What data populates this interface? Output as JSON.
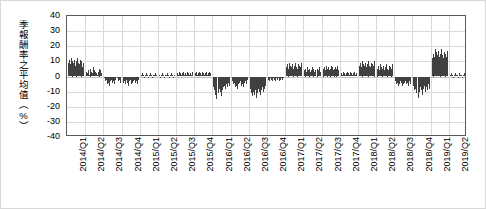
{
  "chart_data": {
    "type": "bar",
    "title": "",
    "subtitle": "",
    "xlabel": "",
    "ylabel": "季報酬率之平均值（%）",
    "ylim": [
      -40,
      40
    ],
    "ytick_labels": [
      "40",
      "30",
      "20",
      "10",
      "0",
      "-10",
      "-20",
      "-30",
      "-40"
    ],
    "ytick_values": [
      40,
      30,
      20,
      10,
      0,
      -10,
      -20,
      -30,
      -40
    ],
    "grid": true,
    "legend": false,
    "legend_position": "none",
    "bar_color": "#404040",
    "categories": [
      "2014/Q1",
      "2014/Q2",
      "2014/Q3",
      "2014/Q4",
      "2015/Q1",
      "2015/Q2",
      "2015/Q3",
      "2015/Q4",
      "2016/Q1",
      "2016/Q2",
      "2016/Q3",
      "2016/Q4",
      "2017/Q1",
      "2017/Q2",
      "2017/Q3",
      "2017/Q4",
      "2018/Q1",
      "2018/Q2",
      "2018/Q3",
      "2018/Q4",
      "2019/Q1",
      "2019/Q2"
    ],
    "series": [
      {
        "name": "季報酬率之平均值",
        "group_values": [
          [
            9,
            11,
            8,
            12,
            10,
            9,
            11,
            7,
            10,
            12,
            9,
            8,
            11,
            10,
            6,
            9
          ],
          [
            3,
            2,
            4,
            1,
            5,
            3,
            2,
            6,
            4,
            3,
            2,
            1,
            3,
            5,
            4,
            2
          ],
          [
            -1,
            -3,
            -2,
            -5,
            -4,
            -6,
            -3,
            -2,
            -4,
            -3,
            -5,
            -2,
            -1,
            -3,
            -2,
            -4
          ],
          [
            -4,
            -3,
            -5,
            -2,
            -4,
            -6,
            -3,
            -2,
            -5,
            -4,
            -3,
            -2,
            -4,
            -3,
            -5,
            -2
          ],
          [
            1,
            2,
            1,
            0,
            1,
            2,
            1,
            0,
            1,
            2,
            1,
            0,
            1,
            1,
            2,
            1
          ],
          [
            1,
            0,
            1,
            2,
            1,
            0,
            1,
            1,
            2,
            1,
            0,
            1,
            2,
            1,
            0,
            1
          ],
          [
            2,
            1,
            3,
            2,
            1,
            2,
            3,
            1,
            2,
            1,
            3,
            2,
            1,
            2,
            1,
            3
          ],
          [
            2,
            3,
            1,
            2,
            3,
            2,
            1,
            3,
            2,
            1,
            2,
            3,
            1,
            2,
            3,
            2
          ],
          [
            -7,
            -9,
            -12,
            -15,
            -11,
            -8,
            -10,
            -13,
            -9,
            -7,
            -6,
            -8,
            -5,
            -7,
            -4,
            -6
          ],
          [
            -3,
            -5,
            -4,
            -7,
            -6,
            -8,
            -5,
            -4,
            -3,
            -6,
            -5,
            -7,
            -4,
            -3,
            -5,
            -2
          ],
          [
            -8,
            -11,
            -13,
            -10,
            -12,
            -9,
            -14,
            -11,
            -8,
            -10,
            -12,
            -9,
            -7,
            -10,
            -8,
            -6
          ],
          [
            -2,
            -3,
            -1,
            -2,
            -3,
            -1,
            -2,
            -3,
            -1,
            -2,
            -1,
            -3,
            -2,
            -1,
            -2,
            -1
          ],
          [
            6,
            8,
            5,
            9,
            7,
            6,
            8,
            5,
            7,
            9,
            6,
            5,
            8,
            7,
            6,
            9
          ],
          [
            4,
            5,
            3,
            6,
            4,
            5,
            3,
            4,
            6,
            5,
            3,
            4,
            5,
            4,
            6,
            3
          ],
          [
            5,
            6,
            4,
            7,
            5,
            6,
            4,
            5,
            7,
            6,
            4,
            5,
            6,
            5,
            7,
            4
          ],
          [
            2,
            1,
            3,
            2,
            1,
            2,
            3,
            2,
            1,
            3,
            2,
            1,
            2,
            3,
            1,
            2
          ],
          [
            7,
            9,
            6,
            10,
            8,
            7,
            9,
            6,
            8,
            10,
            7,
            6,
            9,
            8,
            7,
            10
          ],
          [
            5,
            7,
            4,
            8,
            6,
            5,
            7,
            4,
            6,
            8,
            5,
            4,
            7,
            6,
            5,
            8
          ],
          [
            -3,
            -5,
            -4,
            -6,
            -5,
            -3,
            -4,
            -6,
            -5,
            -4,
            -3,
            -5,
            -4,
            -6,
            -3,
            -5
          ],
          [
            -6,
            -9,
            -8,
            -11,
            -14,
            -10,
            -7,
            -9,
            -12,
            -8,
            -6,
            -10,
            -7,
            -9,
            -5,
            -8
          ],
          [
            12,
            15,
            13,
            18,
            16,
            14,
            17,
            13,
            15,
            18,
            14,
            12,
            16,
            15,
            13,
            17
          ],
          [
            1,
            2,
            1,
            0,
            1,
            2,
            1,
            1,
            0,
            2,
            1,
            1,
            0,
            1,
            2,
            1
          ]
        ]
      }
    ]
  }
}
